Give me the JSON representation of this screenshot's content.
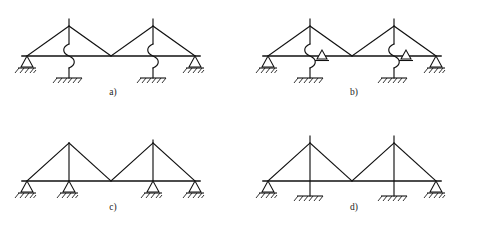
{
  "figure": {
    "panel_count": 4,
    "stroke_color": "#111111",
    "background_color": "#ffffff",
    "panels": [
      {
        "id": "a",
        "label": "a)",
        "label_x": 113,
        "label_y": 95,
        "description": "Two-bay pitched truss on flexible spring columns with pin support at each outer end",
        "origin_x": 0,
        "origin_y": 0,
        "beam_y": 56,
        "beam_x1": 22,
        "beam_x2": 200,
        "ground_y": 73,
        "column_base_y": 78,
        "apex_y": 26,
        "apex_top_y": 19,
        "bays": [
          {
            "left_x": 27,
            "apex_x": 69,
            "right_x": 111,
            "column_x": 69
          },
          {
            "left_x": 111,
            "apex_x": 153,
            "right_x": 195,
            "column_x": 153
          }
        ],
        "supports": [
          {
            "type": "pin-triangle",
            "x": 27,
            "y": 56,
            "ground": "hatched"
          },
          {
            "type": "spring-column-fixed",
            "x": 69,
            "y": 56,
            "ground": "hatched"
          },
          {
            "type": "spring-column-fixed",
            "x": 153,
            "y": 56,
            "ground": "hatched"
          },
          {
            "type": "pin-triangle",
            "x": 195,
            "y": 56,
            "ground": "hatched"
          }
        ]
      },
      {
        "id": "b",
        "label": "b)",
        "label_x": 354,
        "label_y": 95,
        "description": "Two-bay pitched truss on flexible spring columns with an added roller support on the beam at each column and pins at the outer ends",
        "origin_x": 241,
        "origin_y": 0,
        "beam_y": 56,
        "beam_x1": 263,
        "beam_x2": 441,
        "ground_y": 73,
        "column_base_y": 78,
        "apex_y": 26,
        "apex_top_y": 19,
        "bays": [
          {
            "left_x": 268,
            "apex_x": 310,
            "right_x": 352,
            "column_x": 310
          },
          {
            "left_x": 352,
            "apex_x": 394,
            "right_x": 436,
            "column_x": 394
          }
        ],
        "supports": [
          {
            "type": "pin-triangle",
            "x": 268,
            "y": 56,
            "ground": "hatched"
          },
          {
            "type": "spring-column-fixed",
            "x": 310,
            "y": 56,
            "ground": "hatched"
          },
          {
            "type": "roller-on-beam",
            "x": 322,
            "y": 56,
            "ground": "none"
          },
          {
            "type": "spring-column-fixed",
            "x": 394,
            "y": 56,
            "ground": "hatched"
          },
          {
            "type": "roller-on-beam",
            "x": 406,
            "y": 56,
            "ground": "none"
          },
          {
            "type": "pin-triangle",
            "x": 436,
            "y": 56,
            "ground": "hatched"
          }
        ]
      },
      {
        "id": "c",
        "label": "c)",
        "label_x": 113,
        "label_y": 210,
        "description": "Two-bay pitched truss resting directly on four pin supports at beam level",
        "origin_x": 0,
        "origin_y": 115,
        "beam_y": 181,
        "beam_x1": 22,
        "beam_x2": 200,
        "ground_y": 196,
        "apex_y": 143,
        "apex_top_y": 143,
        "bays": [
          {
            "left_x": 27,
            "apex_x": 69,
            "right_x": 111,
            "column_x": 69
          },
          {
            "left_x": 111,
            "apex_x": 153,
            "right_x": 195,
            "column_x": 153
          }
        ],
        "supports": [
          {
            "type": "pin-triangle",
            "x": 27,
            "y": 181,
            "ground": "hatched"
          },
          {
            "type": "pin-triangle",
            "x": 69,
            "y": 181,
            "ground": "hatched"
          },
          {
            "type": "pin-triangle",
            "x": 153,
            "y": 181,
            "ground": "hatched"
          },
          {
            "type": "pin-triangle",
            "x": 195,
            "y": 181,
            "ground": "hatched"
          }
        ]
      },
      {
        "id": "d",
        "label": "d)",
        "label_x": 354,
        "label_y": 210,
        "description": "Two-bay pitched truss on rigid fixed-base columns with pin supports at the outer ends",
        "origin_x": 241,
        "origin_y": 115,
        "beam_y": 181,
        "beam_x1": 263,
        "beam_x2": 441,
        "ground_y": 196,
        "column_base_y": 196,
        "apex_y": 143,
        "apex_top_y": 136,
        "bays": [
          {
            "left_x": 268,
            "apex_x": 310,
            "right_x": 352,
            "column_x": 310
          },
          {
            "left_x": 352,
            "apex_x": 394,
            "right_x": 436,
            "column_x": 394
          }
        ],
        "supports": [
          {
            "type": "pin-triangle",
            "x": 268,
            "y": 181,
            "ground": "hatched"
          },
          {
            "type": "rigid-column-fixed",
            "x": 310,
            "y": 181,
            "ground": "hatched"
          },
          {
            "type": "rigid-column-fixed",
            "x": 394,
            "y": 181,
            "ground": "hatched"
          },
          {
            "type": "pin-triangle",
            "x": 436,
            "y": 181,
            "ground": "hatched"
          }
        ]
      }
    ]
  }
}
